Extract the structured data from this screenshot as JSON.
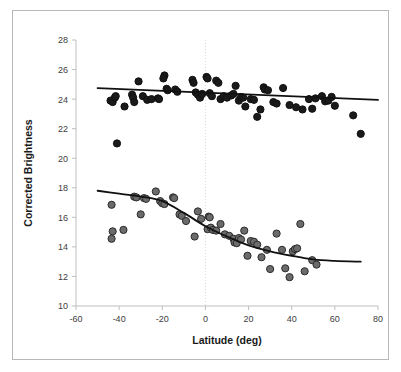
{
  "chart_data": {
    "type": "scatter",
    "title": "",
    "xlabel": "Latitude (deg)",
    "ylabel": "Corrected Brightness",
    "xlim": [
      -60,
      80
    ],
    "ylim": [
      10,
      28
    ],
    "xticks": [
      -60,
      -40,
      -20,
      0,
      20,
      40,
      60,
      80
    ],
    "yticks": [
      10,
      12,
      14,
      16,
      18,
      20,
      22,
      24,
      26,
      28
    ],
    "xtick_labels": [
      "-60",
      "-40",
      "-20",
      "0",
      "20",
      "40",
      "60",
      "80"
    ],
    "ytick_labels": [
      "10",
      "12",
      "14",
      "16",
      "18",
      "20",
      "22",
      "24",
      "26",
      "28"
    ],
    "grid": false,
    "gridlines": [
      {
        "axis": "x",
        "value": 0,
        "style": "dotted",
        "color": "#d9d9d9"
      }
    ],
    "legend": "none",
    "marker_colors": {
      "upper": "#1a1a1a",
      "lower": "#6b6b6b"
    },
    "marker_edge_colors": {
      "upper": "#111111",
      "lower": "#2b2b2b"
    },
    "trendline_color": "#111111",
    "series": [
      {
        "name": "upper",
        "marker": "filled-black-circle",
        "points": [
          [
            -44.0,
            23.9
          ],
          [
            -43.0,
            23.8
          ],
          [
            -42.0,
            24.1
          ],
          [
            -41.6,
            24.2
          ],
          [
            -41.0,
            21.0
          ],
          [
            -37.5,
            23.5
          ],
          [
            -34.0,
            24.3
          ],
          [
            -33.5,
            24.1
          ],
          [
            -33.0,
            23.8
          ],
          [
            -31.0,
            25.2
          ],
          [
            -29.0,
            24.2
          ],
          [
            -27.0,
            23.95
          ],
          [
            -25.0,
            24.0
          ],
          [
            -22.0,
            24.05
          ],
          [
            -21.5,
            24.0
          ],
          [
            -19.0,
            25.6
          ],
          [
            -19.5,
            25.4
          ],
          [
            -18.0,
            24.7
          ],
          [
            -17.5,
            24.6
          ],
          [
            -14.0,
            24.65
          ],
          [
            -13.0,
            24.5
          ],
          [
            -6.0,
            25.3
          ],
          [
            -5.5,
            25.1
          ],
          [
            -4.5,
            24.45
          ],
          [
            -3.5,
            24.3
          ],
          [
            -2.5,
            24.1
          ],
          [
            -1.5,
            24.35
          ],
          [
            0.5,
            25.5
          ],
          [
            1.0,
            25.4
          ],
          [
            2.0,
            24.4
          ],
          [
            3.0,
            24.2
          ],
          [
            5.0,
            25.25
          ],
          [
            6.0,
            25.1
          ],
          [
            7.0,
            24.0
          ],
          [
            8.5,
            24.2
          ],
          [
            10.0,
            24.1
          ],
          [
            12.0,
            24.25
          ],
          [
            13.0,
            24.35
          ],
          [
            14.0,
            24.9
          ],
          [
            15.5,
            23.9
          ],
          [
            16.5,
            24.15
          ],
          [
            17.5,
            24.1
          ],
          [
            18.5,
            23.5
          ],
          [
            21.0,
            24.0
          ],
          [
            22.5,
            23.95
          ],
          [
            24.0,
            22.8
          ],
          [
            25.5,
            23.3
          ],
          [
            27.0,
            24.8
          ],
          [
            27.5,
            24.65
          ],
          [
            29.0,
            24.6
          ],
          [
            31.5,
            23.8
          ],
          [
            33.0,
            23.7
          ],
          [
            36.0,
            24.75
          ],
          [
            39.0,
            23.6
          ],
          [
            42.0,
            23.45
          ],
          [
            45.0,
            23.3
          ],
          [
            48.0,
            24.0
          ],
          [
            49.5,
            23.35
          ],
          [
            51.0,
            24.05
          ],
          [
            54.0,
            24.2
          ],
          [
            55.5,
            23.85
          ],
          [
            57.0,
            23.9
          ],
          [
            58.5,
            24.15
          ],
          [
            60.0,
            23.55
          ],
          [
            68.5,
            22.9
          ],
          [
            72.0,
            21.65
          ]
        ],
        "trend": {
          "type": "line",
          "description": "near-flat slight-decline",
          "x": [
            -50,
            80
          ],
          "y": [
            24.75,
            23.95
          ]
        }
      },
      {
        "name": "lower",
        "marker": "filled-gray-circle",
        "points": [
          [
            -43.5,
            16.85
          ],
          [
            -43.0,
            15.05
          ],
          [
            -43.5,
            14.55
          ],
          [
            -38.0,
            15.15
          ],
          [
            -33.0,
            17.4
          ],
          [
            -32.0,
            17.35
          ],
          [
            -30.0,
            16.2
          ],
          [
            -28.5,
            17.3
          ],
          [
            -27.5,
            17.25
          ],
          [
            -23.0,
            17.75
          ],
          [
            -21.0,
            17.1
          ],
          [
            -20.0,
            16.95
          ],
          [
            -19.0,
            16.9
          ],
          [
            -15.0,
            17.35
          ],
          [
            -14.5,
            17.3
          ],
          [
            -12.0,
            16.2
          ],
          [
            -11.0,
            16.1
          ],
          [
            -9.0,
            15.75
          ],
          [
            -3.5,
            16.4
          ],
          [
            -5.0,
            14.7
          ],
          [
            -2.0,
            15.9
          ],
          [
            1.5,
            16.05
          ],
          [
            2.0,
            16.0
          ],
          [
            1.0,
            15.2
          ],
          [
            2.5,
            15.3
          ],
          [
            3.5,
            15.15
          ],
          [
            5.0,
            15.1
          ],
          [
            7.0,
            15.55
          ],
          [
            9.0,
            14.85
          ],
          [
            11.0,
            14.75
          ],
          [
            13.0,
            14.55
          ],
          [
            13.5,
            14.3
          ],
          [
            14.5,
            14.25
          ],
          [
            15.5,
            14.6
          ],
          [
            16.5,
            14.5
          ],
          [
            18.0,
            15.1
          ],
          [
            19.5,
            13.4
          ],
          [
            21.0,
            14.4
          ],
          [
            22.5,
            14.35
          ],
          [
            24.0,
            14.15
          ],
          [
            26.0,
            13.3
          ],
          [
            28.5,
            13.8
          ],
          [
            30.0,
            12.5
          ],
          [
            33.0,
            14.9
          ],
          [
            35.5,
            13.8
          ],
          [
            37.0,
            12.55
          ],
          [
            39.0,
            11.95
          ],
          [
            40.5,
            13.7
          ],
          [
            41.5,
            13.85
          ],
          [
            42.5,
            13.9
          ],
          [
            44.0,
            15.55
          ],
          [
            46.0,
            12.35
          ],
          [
            49.5,
            13.1
          ],
          [
            51.5,
            12.8
          ]
        ],
        "trend": {
          "type": "sigmoid",
          "description": "high plateau near 17.8 at left, sigmoid decline to plateau near 13.0 at right",
          "x": [
            -50,
            -40,
            -30,
            -20,
            -10,
            0,
            10,
            20,
            30,
            40,
            50,
            60,
            72
          ],
          "y": [
            17.8,
            17.6,
            17.4,
            17.1,
            16.3,
            15.4,
            14.7,
            14.1,
            13.7,
            13.4,
            13.15,
            13.05,
            13.0
          ]
        }
      }
    ]
  }
}
